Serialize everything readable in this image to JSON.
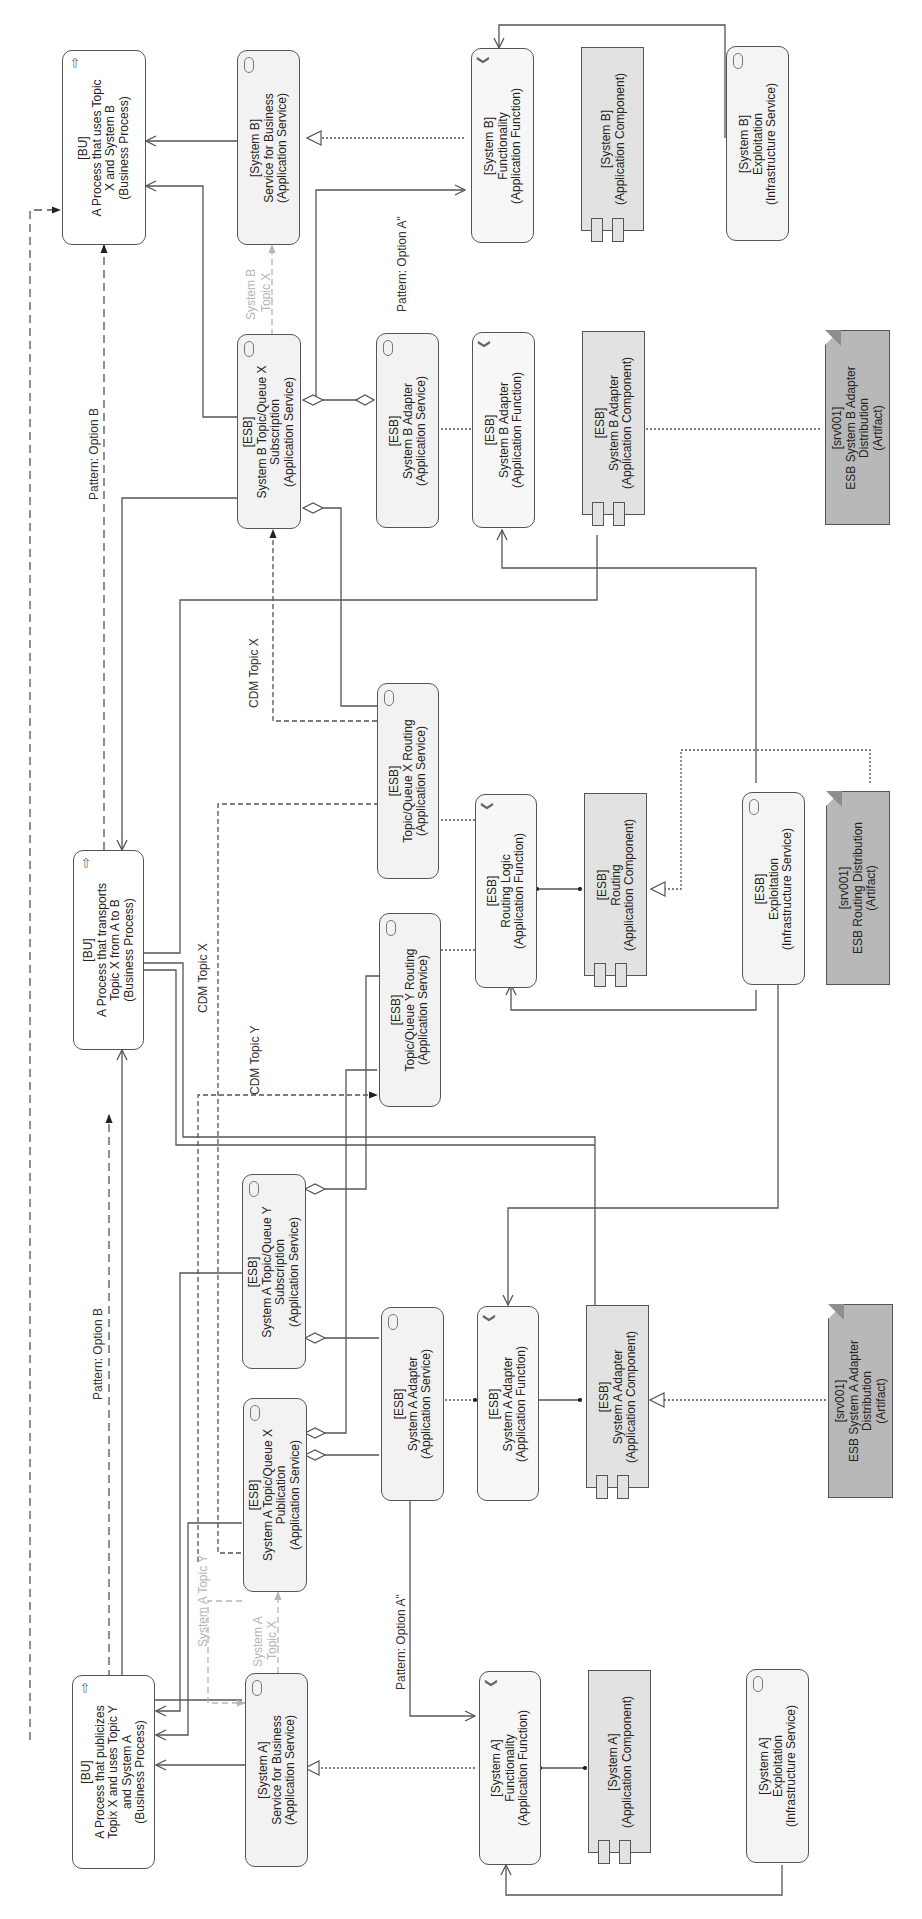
{
  "diagram": {
    "orientation": "rotated-90-ccw",
    "colors": {
      "line": "#555555",
      "faint_line": "#b5b5b5",
      "process_fill": "#ffffff",
      "service_fill": "#f2f2f2",
      "component_fill": "#e2e2e2",
      "artifact_fill": "#b8b8b8"
    },
    "nodes": {
      "bu_system_b": {
        "type": "business-process",
        "icon": "process-arrow-icon",
        "lines": [
          "[BU]",
          "A Process that uses Topic",
          "X and System B",
          "(Business Process)"
        ]
      },
      "sysb_service": {
        "type": "application-service",
        "icon": "service-pill-icon",
        "lines": [
          "[System B]",
          "Service for Business",
          "(Application Service)"
        ]
      },
      "sysb_function": {
        "type": "application-function",
        "icon": "function-chevron-icon",
        "lines": [
          "[System B]",
          "Functionality",
          "(Application Function)"
        ]
      },
      "sysb_component": {
        "type": "application-component",
        "icon": "component-icon",
        "lines": [
          "[System B]",
          "(Application Component)"
        ]
      },
      "sysb_exploitation": {
        "type": "infrastructure-service",
        "icon": "service-pill-icon",
        "lines": [
          "[System B]",
          "Exploitation",
          "(Infrastructure Service)"
        ]
      },
      "esb_sysb_sub": {
        "type": "application-service",
        "icon": "service-pill-icon",
        "lines": [
          "[ESB]",
          "System B Topic/Queue X",
          "Subscription",
          "(Application Service)"
        ]
      },
      "esb_sysb_adapter_svc": {
        "type": "application-service",
        "icon": "service-pill-icon",
        "lines": [
          "[ESB]",
          "System B Adapter",
          "(Application Service)"
        ]
      },
      "esb_sysb_adapter_fn": {
        "type": "application-function",
        "icon": "function-chevron-icon",
        "lines": [
          "[ESB]",
          "System B Adapter",
          "(Application Function)"
        ]
      },
      "esb_sysb_adapter_comp": {
        "type": "application-component",
        "icon": "component-icon",
        "lines": [
          "[ESB]",
          "System B Adapter",
          "(Application Component)"
        ]
      },
      "art_sysb_adapter": {
        "type": "artifact",
        "icon": "artifact-icon",
        "lines": [
          "[srv001]",
          "ESB System B Adapter",
          "Distribution",
          "(Artifact)"
        ]
      },
      "bu_transport": {
        "type": "business-process",
        "icon": "process-arrow-icon",
        "lines": [
          "[BU]",
          "A Process that transports",
          "Topic X from A to B",
          "(Business Process)"
        ]
      },
      "esb_topic_x_routing": {
        "type": "application-service",
        "icon": "service-pill-icon",
        "lines": [
          "[ESB]",
          "Topic/Queue X Routing",
          "(Application Service)"
        ]
      },
      "esb_topic_y_routing": {
        "type": "application-service",
        "icon": "service-pill-icon",
        "lines": [
          "[ESB]",
          "Topic/Queue Y Routing",
          "(Application Service)"
        ]
      },
      "esb_routing_logic": {
        "type": "application-function",
        "icon": "function-chevron-icon",
        "lines": [
          "[ESB]",
          "Routing Logic",
          "(Application Function)"
        ]
      },
      "esb_routing_comp": {
        "type": "application-component",
        "icon": "component-icon",
        "lines": [
          "[ESB]",
          "Routing",
          "(Application Component)"
        ]
      },
      "esb_exploitation": {
        "type": "infrastructure-service",
        "icon": "service-pill-icon",
        "lines": [
          "[ESB]",
          "Exploitation",
          "(Infrastructure Service)"
        ]
      },
      "art_routing": {
        "type": "artifact",
        "icon": "artifact-icon",
        "lines": [
          "[srv001]",
          "ESB Routing Distribution",
          "(Artifact)"
        ]
      },
      "esb_sysa_sub_y": {
        "type": "application-service",
        "icon": "service-pill-icon",
        "lines": [
          "[ESB]",
          "System A Topic/Queue Y",
          "Subscription",
          "(Application Service)"
        ]
      },
      "esb_sysa_pub_x": {
        "type": "application-service",
        "icon": "service-pill-icon",
        "lines": [
          "[ESB]",
          "System A Topic/Queue X",
          "Publication",
          "(Application Service)"
        ]
      },
      "esb_sysa_adapter_svc": {
        "type": "application-service",
        "icon": "service-pill-icon",
        "lines": [
          "[ESB]",
          "System A Adapter",
          "(Application Service)"
        ]
      },
      "esb_sysa_adapter_fn": {
        "type": "application-function",
        "icon": "function-chevron-icon",
        "lines": [
          "[ESB]",
          "System A Adapter",
          "(Application Function)"
        ]
      },
      "esb_sysa_adapter_comp": {
        "type": "application-component",
        "icon": "component-icon",
        "lines": [
          "[ESB]",
          "System A Adapter",
          "(Application Component)"
        ]
      },
      "art_sysa_adapter": {
        "type": "artifact",
        "icon": "artifact-icon",
        "lines": [
          "[srv001]",
          "ESB System A Adapter",
          "Distribution",
          "(Artifact)"
        ]
      },
      "bu_system_a": {
        "type": "business-process",
        "icon": "process-arrow-icon",
        "lines": [
          "[BU]",
          "A Process that publicizes",
          "Topix X and uses Topic Y",
          "and System A",
          "(Business Process)"
        ]
      },
      "sysa_service": {
        "type": "application-service",
        "icon": "service-pill-icon",
        "lines": [
          "[System A]",
          "Service for Business",
          "(Application Service)"
        ]
      },
      "sysa_function": {
        "type": "application-function",
        "icon": "function-chevron-icon",
        "lines": [
          "[System A]",
          "Functionality",
          "(Application Function)"
        ]
      },
      "sysa_component": {
        "type": "application-component",
        "icon": "component-icon",
        "lines": [
          "[System A]",
          "(Application Component)"
        ]
      },
      "sysa_exploitation": {
        "type": "infrastructure-service",
        "icon": "service-pill-icon",
        "lines": [
          "[System A]",
          "Exploitation",
          "(Infrastructure Service)"
        ]
      }
    },
    "edge_labels": {
      "pattern_b_top": "Pattern: Option B",
      "pattern_b_bottom": "Pattern: Option B",
      "pattern_a_top": "Pattern: Option A\"",
      "pattern_a_bottom": "Pattern: Option A\"",
      "sysb_topic_x_1": "System B",
      "sysb_topic_x_2": "Topic X",
      "cdm_topic_x_upper": "CDM Topic X",
      "cdm_topic_x_lower": "CDM Topic X",
      "cdm_topic_y": "CDM Topic Y",
      "sysa_topic_x_1": "System A",
      "sysa_topic_x_2": "Topic X",
      "sysa_topic_y": "System A Topic Y"
    }
  }
}
